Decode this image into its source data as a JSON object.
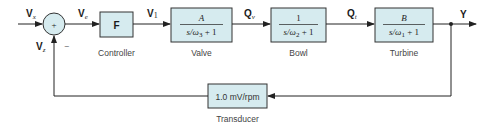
{
  "diagram": {
    "type": "feedback-control-block-diagram",
    "signals": {
      "input": {
        "main": "V",
        "sub": "x"
      },
      "error": {
        "main": "V",
        "sub": "e"
      },
      "feedback": {
        "main": "V",
        "sub": "z"
      },
      "controller_out": {
        "main": "V",
        "sub": "1"
      },
      "valve_out": {
        "main": "Q",
        "sub": "v"
      },
      "bowl_out": {
        "main": "Q",
        "sub": "t"
      },
      "output": {
        "main": "Y"
      }
    },
    "summing_junction": {
      "plus": "+",
      "minus": "−"
    },
    "blocks": {
      "controller": {
        "label": "F",
        "caption": "Controller"
      },
      "valve": {
        "num": "A",
        "den_pre": "s/ω",
        "den_sub": "3",
        "den_post": " + 1",
        "caption": "Valve"
      },
      "bowl": {
        "num": "1",
        "den_pre": "s/ω",
        "den_sub": "2",
        "den_post": " + 1",
        "caption": "Bowl"
      },
      "turbine": {
        "num": "B",
        "den_pre": "s/ω",
        "den_sub": "1",
        "den_post": " + 1",
        "caption": "Turbine"
      },
      "transducer": {
        "label": "1.0 mV/rpm",
        "caption": "Transducer"
      }
    },
    "colors": {
      "block_fill": "#d6ebef",
      "line": "#222222"
    }
  }
}
